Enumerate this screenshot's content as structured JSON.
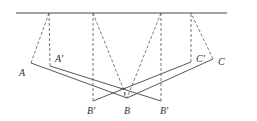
{
  "diagram": {
    "type": "geometry-reflection",
    "colors": {
      "line": "#444444",
      "dash": "#555555",
      "label": "#333333"
    },
    "labels": {
      "A": "A",
      "A_prime": "A'",
      "B": "B",
      "B_prime_left": "B'",
      "B_prime_right": "B'",
      "C": "C",
      "C_prime": "C'"
    }
  }
}
